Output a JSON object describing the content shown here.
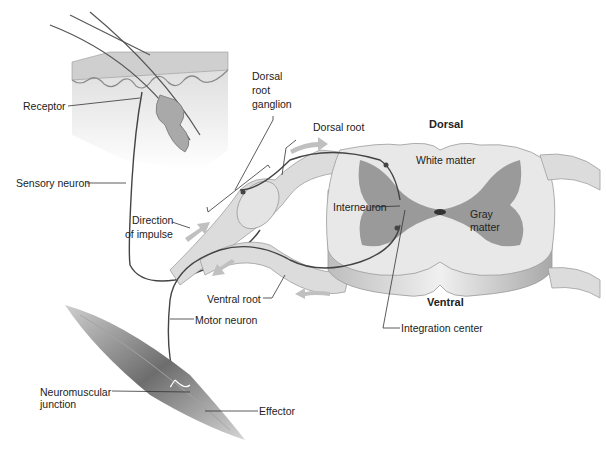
{
  "diagram": {
    "type": "reflex-arc",
    "labels": {
      "receptor": "Receptor",
      "dorsal_root_ganglion_1": "Dorsal",
      "dorsal_root_ganglion_2": "root",
      "dorsal_root_ganglion_3": "ganglion",
      "dorsal_root": "Dorsal root",
      "dorsal": "Dorsal",
      "white_matter": "White matter",
      "sensory_neuron": "Sensory neuron",
      "direction_1": "Direction",
      "direction_2": "of impulse",
      "interneuron": "Interneuron",
      "gray_matter_1": "Gray",
      "gray_matter_2": "matter",
      "ventral_root": "Ventral root",
      "ventral": "Ventral",
      "motor_neuron": "Motor neuron",
      "integration_center": "Integration center",
      "neuromuscular_1": "Neuromuscular",
      "neuromuscular_2": "junction",
      "effector": "Effector"
    },
    "colors": {
      "gray_matter": "#9a9a9a",
      "white_matter": "#e6e6e6",
      "nerve": "#d8d8d8",
      "neuron_line": "#444444",
      "arrow": "#bdbdbd",
      "muscle": "#7a7a7a"
    }
  }
}
